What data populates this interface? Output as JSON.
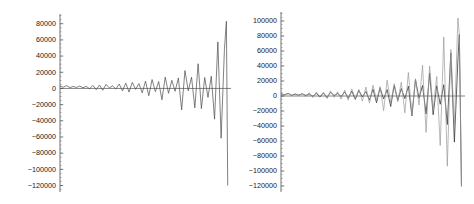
{
  "figure": {
    "background": "#ffffff",
    "panel_count": 2
  },
  "chart_data": [
    {
      "type": "line",
      "title": "",
      "subtitle": "",
      "xlabel": "",
      "ylabel": "",
      "panel": "left",
      "grid": false,
      "legend": "none",
      "axis_color": "#4d4d4d",
      "zero_line": 0,
      "ylim": [
        -128000,
        92000
      ],
      "xlim": [
        0,
        52
      ],
      "yticks": [
        80000,
        60000,
        40000,
        20000,
        0,
        -20000,
        -40000,
        -60000,
        -80000,
        -100000,
        -120000
      ],
      "ytick_labels": [
        "80000",
        "60000",
        "40000",
        "20000",
        "0",
        "−20000",
        "−40000",
        "−60000",
        "−80000",
        "−100000",
        "−120000"
      ],
      "minor_tick_interval": 5000,
      "x_axis_visible": false,
      "series": [
        {
          "name": "solution-a",
          "color": "#4a4a4a",
          "width": 0.7,
          "x": [
            0,
            1,
            2,
            3,
            4,
            5,
            6,
            7,
            8,
            9,
            10,
            11,
            12,
            13,
            14,
            15,
            16,
            17,
            18,
            19,
            20,
            21,
            22,
            23,
            24,
            25,
            26,
            27,
            28,
            29,
            30,
            31,
            32,
            33,
            34,
            35,
            36,
            37,
            38,
            39,
            40,
            41,
            42,
            43,
            44,
            45,
            46,
            47,
            48,
            49,
            50
          ],
          "values": [
            3000,
            1500,
            3500,
            1000,
            2500,
            1200,
            3000,
            800,
            2600,
            -500,
            3800,
            -1500,
            4200,
            -2200,
            5000,
            700,
            3200,
            -800,
            5500,
            -3000,
            6500,
            -4500,
            7500,
            -1200,
            6000,
            -5500,
            9000,
            -9000,
            11000,
            -4000,
            8500,
            -14000,
            14000,
            -6000,
            10000,
            -3500,
            13000,
            -26500,
            22000,
            -3000,
            14000,
            -24000,
            30500,
            -25000,
            13500,
            -11000,
            15000,
            -38000,
            57500,
            -61500,
            48000
          ]
        }
      ],
      "tail": {
        "note": "final plunge",
        "x": [
          50,
          50.6,
          51
        ],
        "values": [
          48000,
          83000,
          -120000
        ]
      }
    },
    {
      "type": "line",
      "title": "",
      "subtitle": "",
      "xlabel": "",
      "ylabel": "",
      "panel": "right",
      "grid": false,
      "legend": "none",
      "axis_color": "#4d4d4d",
      "zero_line": 0,
      "ylim": [
        -128000,
        112000
      ],
      "xlim": [
        0,
        52
      ],
      "yticks": [
        100000,
        80000,
        60000,
        40000,
        20000,
        0,
        -20000,
        -40000,
        -60000,
        -80000,
        -100000,
        -120000
      ],
      "ytick_labels": [
        "100000",
        "80000",
        "60000",
        "40000",
        "20000",
        "0",
        "−20000",
        "−40000",
        "−60000",
        "−80000",
        "−100000",
        "−120000"
      ],
      "minor_tick_interval": 5000,
      "x_axis_visible": false,
      "series": [
        {
          "name": "solution-a",
          "color": "#3a3a3a",
          "width": 0.8,
          "x": [
            0,
            1,
            2,
            3,
            4,
            5,
            6,
            7,
            8,
            9,
            10,
            11,
            12,
            13,
            14,
            15,
            16,
            17,
            18,
            19,
            20,
            21,
            22,
            23,
            24,
            25,
            26,
            27,
            28,
            29,
            30,
            31,
            32,
            33,
            34,
            35,
            36,
            37,
            38,
            39,
            40,
            41,
            42,
            43,
            44,
            45,
            46,
            47,
            48,
            49,
            50
          ],
          "values": [
            3000,
            1500,
            3500,
            1000,
            2500,
            1200,
            3000,
            800,
            2600,
            -500,
            3800,
            -1500,
            4200,
            -2200,
            5000,
            700,
            3200,
            -800,
            5500,
            -3000,
            6500,
            -4500,
            7500,
            -1200,
            6000,
            -5500,
            9000,
            -9000,
            11000,
            -4000,
            8500,
            -14000,
            14000,
            -6000,
            10000,
            -3500,
            13000,
            -26500,
            22000,
            -3000,
            14000,
            -24000,
            30500,
            -25000,
            13500,
            -11000,
            15000,
            -38000,
            57500,
            -61500,
            48000
          ]
        },
        {
          "name": "solution-b",
          "color": "#9a9a9a",
          "width": 0.7,
          "x": [
            0,
            1,
            2,
            3,
            4,
            5,
            6,
            7,
            8,
            9,
            10,
            11,
            12,
            13,
            14,
            15,
            16,
            17,
            18,
            19,
            20,
            21,
            22,
            23,
            24,
            25,
            26,
            27,
            28,
            29,
            30,
            31,
            32,
            33,
            34,
            35,
            36,
            37,
            38,
            39,
            40,
            41,
            42,
            43,
            44,
            45,
            46,
            47,
            48,
            49,
            50
          ],
          "values": [
            2800,
            1800,
            3200,
            900,
            2900,
            600,
            3300,
            -900,
            4500,
            -2000,
            5200,
            -800,
            4800,
            -3500,
            6800,
            -1800,
            5800,
            -4200,
            8000,
            -5500,
            9500,
            -3000,
            8800,
            -7000,
            12000,
            -9500,
            14500,
            -5000,
            12500,
            -19500,
            21000,
            -9000,
            16500,
            -7500,
            18500,
            -22500,
            31500,
            -26000,
            23000,
            -12000,
            41000,
            -48500,
            40000,
            -19000,
            26000,
            -66000,
            78500,
            -93500,
            62000,
            -39000,
            104000
          ]
        }
      ],
      "tail": {
        "note": "final plunge",
        "x": [
          50,
          50.4,
          51
        ],
        "values": [
          48000,
          82000,
          -120500
        ]
      }
    }
  ]
}
